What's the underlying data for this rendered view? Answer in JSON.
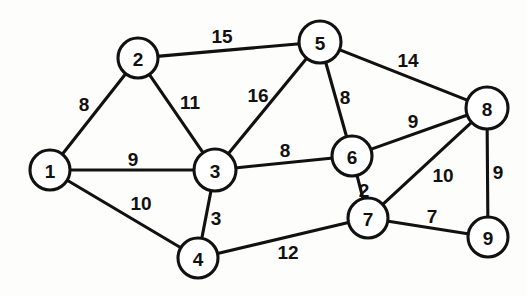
{
  "figure": {
    "background_color": "#fdfdfc",
    "line_color": "#111111",
    "node_fill_color": "#ffffff",
    "width": 527,
    "height": 296
  },
  "chart_data": {
    "type": "diagram",
    "diagram_kind": "weighted-undirected-graph",
    "title": "",
    "node_count": 9,
    "edge_count": 15,
    "nodes": [
      {
        "id": "1",
        "label": "1",
        "x": 50,
        "y": 170,
        "r": 20
      },
      {
        "id": "2",
        "label": "2",
        "x": 138,
        "y": 58,
        "r": 20
      },
      {
        "id": "3",
        "label": "3",
        "x": 215,
        "y": 170,
        "r": 21
      },
      {
        "id": "4",
        "label": "4",
        "x": 198,
        "y": 258,
        "r": 20
      },
      {
        "id": "5",
        "label": "5",
        "x": 320,
        "y": 42,
        "r": 21
      },
      {
        "id": "6",
        "label": "6",
        "x": 352,
        "y": 156,
        "r": 20
      },
      {
        "id": "7",
        "label": "7",
        "x": 368,
        "y": 218,
        "r": 20
      },
      {
        "id": "8",
        "label": "8",
        "x": 487,
        "y": 108,
        "r": 21
      },
      {
        "id": "9",
        "label": "9",
        "x": 488,
        "y": 237,
        "r": 20
      }
    ],
    "edges": [
      {
        "source": "1",
        "target": "2",
        "weight": "8",
        "label_x": 84,
        "label_y": 104
      },
      {
        "source": "1",
        "target": "3",
        "weight": "9",
        "label_x": 133,
        "label_y": 159
      },
      {
        "source": "1",
        "target": "4",
        "weight": "10",
        "label_x": 141,
        "label_y": 203
      },
      {
        "source": "2",
        "target": "3",
        "weight": "11",
        "label_x": 190,
        "label_y": 102
      },
      {
        "source": "2",
        "target": "5",
        "weight": "15",
        "label_x": 222,
        "label_y": 36
      },
      {
        "source": "3",
        "target": "5",
        "weight": "16",
        "label_x": 258,
        "label_y": 95
      },
      {
        "source": "3",
        "target": "6",
        "weight": "8",
        "label_x": 285,
        "label_y": 150
      },
      {
        "source": "3",
        "target": "4",
        "weight": "3",
        "label_x": 216,
        "label_y": 218
      },
      {
        "source": "4",
        "target": "7",
        "weight": "12",
        "label_x": 288,
        "label_y": 252
      },
      {
        "source": "5",
        "target": "6",
        "weight": "8",
        "label_x": 345,
        "label_y": 97
      },
      {
        "source": "5",
        "target": "8",
        "weight": "14",
        "label_x": 408,
        "label_y": 60
      },
      {
        "source": "6",
        "target": "7",
        "weight": "2",
        "label_x": 364,
        "label_y": 190
      },
      {
        "source": "6",
        "target": "8",
        "weight": "9",
        "label_x": 413,
        "label_y": 121
      },
      {
        "source": "7",
        "target": "8",
        "weight": "10",
        "label_x": 443,
        "label_y": 175
      },
      {
        "source": "7",
        "target": "9",
        "weight": "7",
        "label_x": 432,
        "label_y": 216
      },
      {
        "source": "8",
        "target": "9",
        "weight": "9",
        "label_x": 498,
        "label_y": 172
      }
    ]
  }
}
